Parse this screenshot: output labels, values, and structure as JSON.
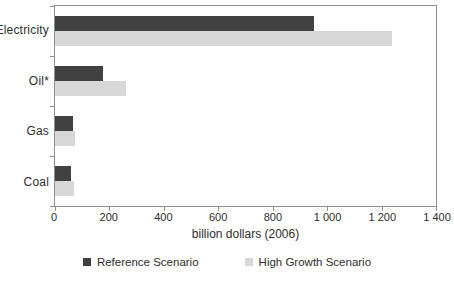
{
  "chart_data": {
    "type": "bar",
    "orientation": "horizontal",
    "title": "",
    "categories": [
      "Electricity",
      "Oil*",
      "Gas",
      "Coal"
    ],
    "series": [
      {
        "name": "Reference Scenario",
        "color": "#414141",
        "values": [
          950,
          175,
          65,
          60
        ]
      },
      {
        "name": "High Growth Scenario",
        "color": "#d8d8d8",
        "values": [
          1240,
          260,
          75,
          70
        ]
      }
    ],
    "xlabel": "billion dollars (2006)",
    "ylabel": "",
    "xlim": [
      0,
      1400
    ],
    "xticks": [
      0,
      200,
      400,
      600,
      800,
      1000,
      1200,
      1400
    ],
    "xtick_labels": [
      "0",
      "200",
      "400",
      "600",
      "800",
      "1 000",
      "1 200",
      "1 400"
    ],
    "grid": false,
    "legend_position": "bottom",
    "axis_color": "#8f8f8f",
    "text_color": "#2e2e2e",
    "plot_background": "#ffffff"
  }
}
